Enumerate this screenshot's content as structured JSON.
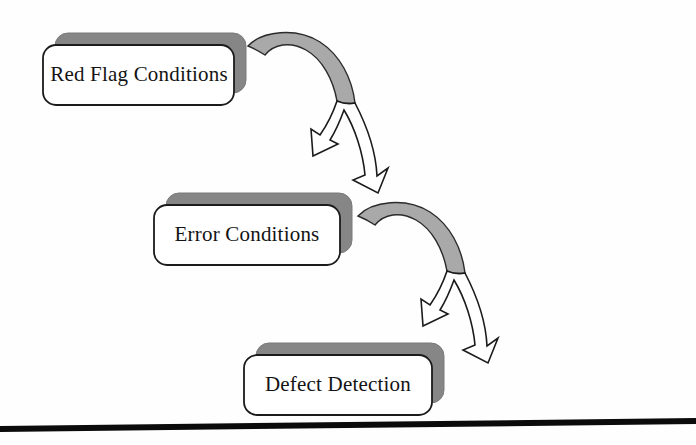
{
  "page": {
    "background_color": "#fefefe",
    "width": 696,
    "height": 445
  },
  "diagram": {
    "type": "cascading-flow",
    "title": "",
    "orientation": "top-left to bottom-right cascade",
    "node_style": {
      "shape": "rounded-rectangle",
      "face_color": "#ffffff",
      "border_color": "#1b1b1b",
      "shadow_color": "#868686",
      "shadow_offset_x": 11,
      "shadow_offset_y": -11
    },
    "connector_style": {
      "type": "curved-arrow",
      "arc_fill": "#a9a9a9",
      "arrow_fill": "#ffffff",
      "outline_color": "#1b1b1b"
    },
    "nodes": [
      {
        "id": "red-flag-conditions",
        "label": "Red Flag Conditions",
        "x": 43,
        "y": 45,
        "width": 191,
        "height": 60
      },
      {
        "id": "error-conditions",
        "label": "Error Conditions",
        "x": 154,
        "y": 205,
        "width": 186,
        "height": 60
      },
      {
        "id": "defect-detection",
        "label": "Defect Detection",
        "x": 244,
        "y": 355,
        "width": 188,
        "height": 60
      }
    ],
    "connectors": [
      {
        "id": "arrow-red-flag-to-error",
        "from": "red-flag-conditions",
        "to": "error-conditions",
        "label": ""
      },
      {
        "id": "arrow-error-to-defect",
        "from": "error-conditions",
        "to": "defect-detection",
        "label": ""
      }
    ]
  },
  "footer_rule": {
    "id": "page-bottom-rule",
    "color": "#0b0b0b",
    "x1": 0,
    "y1": 429,
    "x2": 696,
    "y2": 421,
    "thickness": 6
  }
}
